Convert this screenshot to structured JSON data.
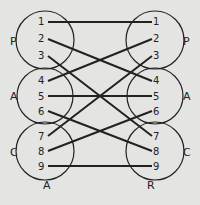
{
  "diagram": {
    "background": "#e4e4e2",
    "stroke_color": "#222222",
    "left_column": {
      "title": "A",
      "groups": [
        {
          "label": "P",
          "items": [
            "1",
            "2",
            "3"
          ]
        },
        {
          "label": "A",
          "items": [
            "4",
            "5",
            "6"
          ]
        },
        {
          "label": "C",
          "items": [
            "7",
            "8",
            "9"
          ]
        }
      ]
    },
    "right_column": {
      "title": "R",
      "groups": [
        {
          "label": "P",
          "items": [
            "1",
            "2",
            "3"
          ]
        },
        {
          "label": "A",
          "items": [
            "4",
            "5",
            "6"
          ]
        },
        {
          "label": "C",
          "items": [
            "7",
            "8",
            "9"
          ]
        }
      ]
    },
    "connections": [
      {
        "from": "1",
        "to": "1"
      },
      {
        "from": "2",
        "to": "4"
      },
      {
        "from": "3",
        "to": "7"
      },
      {
        "from": "4",
        "to": "2"
      },
      {
        "from": "5",
        "to": "5"
      },
      {
        "from": "6",
        "to": "8"
      },
      {
        "from": "7",
        "to": "3"
      },
      {
        "from": "8",
        "to": "6"
      },
      {
        "from": "9",
        "to": "9"
      }
    ]
  }
}
